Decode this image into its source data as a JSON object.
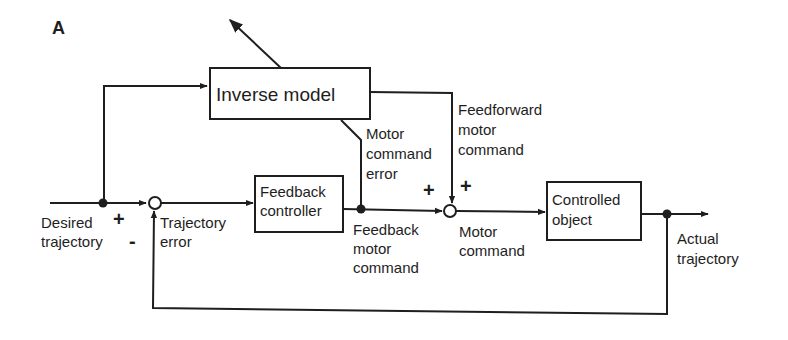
{
  "figure": {
    "panel_label": "A",
    "blocks": {
      "inverse_model": "Inverse model",
      "feedback_controller": [
        "Feedback",
        "controller"
      ],
      "controlled_object": [
        "Controlled",
        "object"
      ]
    },
    "signals": {
      "desired_trajectory": [
        "Desired",
        "trajectory"
      ],
      "trajectory_error": [
        "Trajectory",
        "error"
      ],
      "motor_command_error": [
        "Motor",
        "command",
        "error"
      ],
      "feedforward_motor_command": [
        "Feedforward",
        "motor",
        "command"
      ],
      "feedback_motor_command": [
        "Feedback",
        "motor",
        "command"
      ],
      "motor_command": [
        "Motor",
        "command"
      ],
      "actual_trajectory": [
        "Actual",
        "trajectory"
      ]
    },
    "signs": {
      "sum1_plus": "+",
      "sum1_minus": "-",
      "sum2_left_plus": "+",
      "sum2_top_plus": "+"
    }
  }
}
